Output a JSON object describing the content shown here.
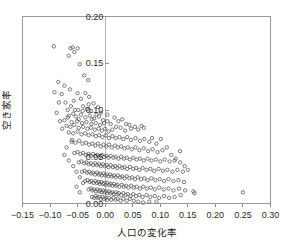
{
  "chart_data": {
    "type": "scatter",
    "title": "",
    "xlabel": "人口の変化率",
    "ylabel": "空き家率",
    "xlim": [
      -0.15,
      0.3
    ],
    "ylim": [
      0.0,
      0.2
    ],
    "xticks": [
      -0.15,
      -0.1,
      -0.05,
      0.0,
      0.05,
      0.1,
      0.15,
      0.2,
      0.25,
      0.3
    ],
    "xticklabels": [
      "−0.15",
      "−0.10",
      "−0.05",
      "0.00",
      "0.05",
      "0.10",
      "0.15",
      "0.20",
      "0.25",
      "0.30"
    ],
    "yticks": [
      0.0,
      0.05,
      0.1,
      0.15,
      0.2
    ],
    "yticklabels": [
      "0.00",
      "0.05",
      "0.10",
      "0.15",
      "0.20"
    ],
    "grid": false,
    "legend": null,
    "marker": "open-circle",
    "marker_color": "#5b5b5b",
    "marker_size": 3.4,
    "n_points": 372,
    "points": [
      [
        -0.093,
        0.168
      ],
      [
        -0.063,
        0.166
      ],
      [
        -0.059,
        0.167
      ],
      [
        -0.05,
        0.166
      ],
      [
        -0.066,
        0.158
      ],
      [
        -0.056,
        0.162
      ],
      [
        -0.046,
        0.149
      ],
      [
        -0.038,
        0.137
      ],
      [
        -0.085,
        0.13
      ],
      [
        -0.074,
        0.126
      ],
      [
        -0.031,
        0.132
      ],
      [
        -0.064,
        0.122
      ],
      [
        -0.05,
        0.118
      ],
      [
        -0.036,
        0.118
      ],
      [
        -0.029,
        0.114
      ],
      [
        -0.057,
        0.11
      ],
      [
        -0.044,
        0.112
      ],
      [
        -0.021,
        0.107
      ],
      [
        -0.04,
        0.104
      ],
      [
        -0.033,
        0.101
      ],
      [
        -0.049,
        0.1
      ],
      [
        -0.026,
        0.099
      ],
      [
        -0.013,
        0.103
      ],
      [
        -0.058,
        0.096
      ],
      [
        -0.066,
        0.094
      ],
      [
        -0.068,
        0.092
      ],
      [
        -0.053,
        0.093
      ],
      [
        -0.044,
        0.095
      ],
      [
        -0.036,
        0.092
      ],
      [
        -0.028,
        0.094
      ],
      [
        -0.02,
        0.091
      ],
      [
        -0.011,
        0.093
      ],
      [
        -0.004,
        0.089
      ],
      [
        -0.074,
        0.089
      ],
      [
        -0.061,
        0.087
      ],
      [
        -0.051,
        0.088
      ],
      [
        -0.042,
        0.086
      ],
      [
        -0.034,
        0.087
      ],
      [
        -0.025,
        0.085
      ],
      [
        -0.017,
        0.086
      ],
      [
        -0.009,
        0.084
      ],
      [
        -0.002,
        0.086
      ],
      [
        0.004,
        0.088
      ],
      [
        0.01,
        0.085
      ],
      [
        -0.07,
        0.083
      ],
      [
        -0.063,
        0.082
      ],
      [
        -0.056,
        0.084
      ],
      [
        -0.048,
        0.081
      ],
      [
        -0.04,
        0.082
      ],
      [
        -0.032,
        0.08
      ],
      [
        -0.026,
        0.081
      ],
      [
        -0.019,
        0.079
      ],
      [
        -0.012,
        0.08
      ],
      [
        -0.006,
        0.078
      ],
      [
        0.0,
        0.08
      ],
      [
        0.006,
        0.077
      ],
      [
        0.013,
        0.079
      ],
      [
        0.02,
        0.082
      ],
      [
        0.028,
        0.081
      ],
      [
        0.036,
        0.078
      ],
      [
        0.047,
        0.08
      ],
      [
        0.054,
        0.082
      ],
      [
        0.06,
        0.079
      ],
      [
        -0.066,
        0.076
      ],
      [
        -0.058,
        0.075
      ],
      [
        -0.05,
        0.077
      ],
      [
        -0.043,
        0.074
      ],
      [
        -0.036,
        0.075
      ],
      [
        -0.03,
        0.073
      ],
      [
        -0.023,
        0.074
      ],
      [
        -0.017,
        0.072
      ],
      [
        -0.011,
        0.073
      ],
      [
        -0.005,
        0.071
      ],
      [
        0.001,
        0.073
      ],
      [
        0.007,
        0.07
      ],
      [
        0.013,
        0.072
      ],
      [
        0.019,
        0.07
      ],
      [
        0.026,
        0.071
      ],
      [
        0.033,
        0.069
      ],
      [
        0.04,
        0.071
      ],
      [
        0.047,
        0.068
      ],
      [
        0.055,
        0.07
      ],
      [
        0.063,
        0.067
      ],
      [
        0.071,
        0.069
      ],
      [
        0.08,
        0.066
      ],
      [
        0.101,
        0.069
      ],
      [
        -0.061,
        0.066
      ],
      [
        -0.054,
        0.065
      ],
      [
        -0.047,
        0.067
      ],
      [
        -0.041,
        0.064
      ],
      [
        -0.035,
        0.065
      ],
      [
        -0.029,
        0.063
      ],
      [
        -0.023,
        0.064
      ],
      [
        -0.018,
        0.062
      ],
      [
        -0.013,
        0.064
      ],
      [
        -0.008,
        0.061
      ],
      [
        -0.003,
        0.063
      ],
      [
        0.002,
        0.061
      ],
      [
        0.007,
        0.063
      ],
      [
        0.012,
        0.06
      ],
      [
        0.018,
        0.062
      ],
      [
        0.023,
        0.06
      ],
      [
        0.029,
        0.061
      ],
      [
        0.035,
        0.059
      ],
      [
        0.041,
        0.06
      ],
      [
        0.048,
        0.058
      ],
      [
        0.055,
        0.06
      ],
      [
        0.062,
        0.057
      ],
      [
        0.07,
        0.059
      ],
      [
        0.078,
        0.056
      ],
      [
        0.086,
        0.058
      ],
      [
        0.095,
        0.055
      ],
      [
        0.104,
        0.057
      ],
      [
        -0.056,
        0.054
      ],
      [
        -0.05,
        0.055
      ],
      [
        -0.045,
        0.053
      ],
      [
        -0.04,
        0.054
      ],
      [
        -0.035,
        0.052
      ],
      [
        -0.03,
        0.053
      ],
      [
        -0.026,
        0.051
      ],
      [
        -0.022,
        0.053
      ],
      [
        -0.018,
        0.051
      ],
      [
        -0.014,
        0.052
      ],
      [
        -0.01,
        0.05
      ],
      [
        -0.006,
        0.052
      ],
      [
        -0.002,
        0.05
      ],
      [
        0.002,
        0.051
      ],
      [
        0.006,
        0.049
      ],
      [
        0.01,
        0.051
      ],
      [
        0.015,
        0.049
      ],
      [
        0.019,
        0.05
      ],
      [
        0.024,
        0.048
      ],
      [
        0.029,
        0.05
      ],
      [
        0.034,
        0.048
      ],
      [
        0.039,
        0.049
      ],
      [
        0.045,
        0.047
      ],
      [
        0.051,
        0.049
      ],
      [
        0.057,
        0.047
      ],
      [
        0.063,
        0.048
      ],
      [
        0.07,
        0.046
      ],
      [
        0.077,
        0.048
      ],
      [
        0.084,
        0.046
      ],
      [
        0.092,
        0.047
      ],
      [
        0.1,
        0.045
      ],
      [
        0.108,
        0.047
      ],
      [
        0.117,
        0.045
      ],
      [
        0.126,
        0.046
      ],
      [
        0.136,
        0.044
      ],
      [
        -0.048,
        0.044
      ],
      [
        -0.043,
        0.045
      ],
      [
        -0.038,
        0.043
      ],
      [
        -0.034,
        0.044
      ],
      [
        -0.03,
        0.042
      ],
      [
        -0.026,
        0.043
      ],
      [
        -0.022,
        0.041
      ],
      [
        -0.018,
        0.043
      ],
      [
        -0.015,
        0.041
      ],
      [
        -0.011,
        0.042
      ],
      [
        -0.008,
        0.04
      ],
      [
        -0.004,
        0.042
      ],
      [
        -0.001,
        0.04
      ],
      [
        0.003,
        0.041
      ],
      [
        0.006,
        0.039
      ],
      [
        0.01,
        0.041
      ],
      [
        0.014,
        0.039
      ],
      [
        0.018,
        0.04
      ],
      [
        0.022,
        0.038
      ],
      [
        0.026,
        0.04
      ],
      [
        0.031,
        0.038
      ],
      [
        0.035,
        0.039
      ],
      [
        0.04,
        0.037
      ],
      [
        0.045,
        0.039
      ],
      [
        0.051,
        0.037
      ],
      [
        0.056,
        0.038
      ],
      [
        0.062,
        0.036
      ],
      [
        0.068,
        0.038
      ],
      [
        0.075,
        0.036
      ],
      [
        0.082,
        0.037
      ],
      [
        0.089,
        0.035
      ],
      [
        0.097,
        0.037
      ],
      [
        0.105,
        0.035
      ],
      [
        0.113,
        0.036
      ],
      [
        0.122,
        0.034
      ],
      [
        0.131,
        0.036
      ],
      [
        0.141,
        0.034
      ],
      [
        -0.042,
        0.034
      ],
      [
        -0.037,
        0.035
      ],
      [
        -0.033,
        0.033
      ],
      [
        -0.029,
        0.034
      ],
      [
        -0.025,
        0.032
      ],
      [
        -0.022,
        0.033
      ],
      [
        -0.018,
        0.031
      ],
      [
        -0.015,
        0.033
      ],
      [
        -0.012,
        0.031
      ],
      [
        -0.009,
        0.032
      ],
      [
        -0.006,
        0.03
      ],
      [
        -0.003,
        0.032
      ],
      [
        0.0,
        0.03
      ],
      [
        0.003,
        0.031
      ],
      [
        0.006,
        0.029
      ],
      [
        0.009,
        0.031
      ],
      [
        0.012,
        0.029
      ],
      [
        0.016,
        0.03
      ],
      [
        0.019,
        0.028
      ],
      [
        0.023,
        0.03
      ],
      [
        0.027,
        0.028
      ],
      [
        0.031,
        0.029
      ],
      [
        0.035,
        0.027
      ],
      [
        0.039,
        0.029
      ],
      [
        0.044,
        0.027
      ],
      [
        0.049,
        0.028
      ],
      [
        0.054,
        0.026
      ],
      [
        0.059,
        0.028
      ],
      [
        0.065,
        0.026
      ],
      [
        0.071,
        0.027
      ],
      [
        0.077,
        0.025
      ],
      [
        0.084,
        0.027
      ],
      [
        0.091,
        0.025
      ],
      [
        0.099,
        0.026
      ],
      [
        0.107,
        0.024
      ],
      [
        0.115,
        0.026
      ],
      [
        0.124,
        0.024
      ],
      [
        0.133,
        0.025
      ],
      [
        0.143,
        0.023
      ],
      [
        -0.036,
        0.024
      ],
      [
        -0.032,
        0.025
      ],
      [
        -0.028,
        0.023
      ],
      [
        -0.025,
        0.024
      ],
      [
        -0.021,
        0.022
      ],
      [
        -0.018,
        0.024
      ],
      [
        -0.015,
        0.022
      ],
      [
        -0.012,
        0.023
      ],
      [
        -0.01,
        0.021
      ],
      [
        -0.007,
        0.023
      ],
      [
        -0.004,
        0.021
      ],
      [
        -0.002,
        0.022
      ],
      [
        0.001,
        0.02
      ],
      [
        0.004,
        0.022
      ],
      [
        0.007,
        0.02
      ],
      [
        0.01,
        0.021
      ],
      [
        0.013,
        0.019
      ],
      [
        0.016,
        0.021
      ],
      [
        0.019,
        0.019
      ],
      [
        0.022,
        0.02
      ],
      [
        0.026,
        0.018
      ],
      [
        0.03,
        0.02
      ],
      [
        0.034,
        0.018
      ],
      [
        0.038,
        0.019
      ],
      [
        0.042,
        0.017
      ],
      [
        0.047,
        0.019
      ],
      [
        0.052,
        0.017
      ],
      [
        0.057,
        0.018
      ],
      [
        0.063,
        0.016
      ],
      [
        0.069,
        0.018
      ],
      [
        0.076,
        0.016
      ],
      [
        0.083,
        0.017
      ],
      [
        0.09,
        0.015
      ],
      [
        0.098,
        0.017
      ],
      [
        0.106,
        0.015
      ],
      [
        0.115,
        0.016
      ],
      [
        0.124,
        0.014
      ],
      [
        0.134,
        0.016
      ],
      [
        0.145,
        0.014
      ],
      [
        -0.03,
        0.015
      ],
      [
        -0.026,
        0.016
      ],
      [
        -0.023,
        0.014
      ],
      [
        -0.02,
        0.015
      ],
      [
        -0.017,
        0.013
      ],
      [
        -0.014,
        0.015
      ],
      [
        -0.011,
        0.013
      ],
      [
        -0.009,
        0.014
      ],
      [
        -0.006,
        0.012
      ],
      [
        -0.004,
        0.014
      ],
      [
        -0.001,
        0.012
      ],
      [
        0.002,
        0.013
      ],
      [
        0.004,
        0.011
      ],
      [
        0.007,
        0.013
      ],
      [
        0.01,
        0.011
      ],
      [
        0.013,
        0.012
      ],
      [
        0.016,
        0.01
      ],
      [
        0.019,
        0.012
      ],
      [
        0.022,
        0.01
      ],
      [
        0.025,
        0.011
      ],
      [
        0.029,
        0.009
      ],
      [
        0.033,
        0.011
      ],
      [
        0.037,
        0.009
      ],
      [
        0.041,
        0.01
      ],
      [
        0.046,
        0.008
      ],
      [
        0.051,
        0.01
      ],
      [
        0.056,
        0.008
      ],
      [
        0.062,
        0.009
      ],
      [
        0.068,
        0.007
      ],
      [
        0.075,
        0.009
      ],
      [
        0.082,
        0.007
      ],
      [
        0.09,
        0.008
      ],
      [
        0.098,
        0.006
      ],
      [
        0.107,
        0.008
      ],
      [
        0.116,
        0.006
      ],
      [
        0.126,
        0.007
      ],
      [
        0.137,
        0.009
      ],
      [
        0.16,
        0.013
      ],
      [
        0.162,
        0.011
      ],
      [
        0.25,
        0.012
      ],
      [
        -0.024,
        0.007
      ],
      [
        -0.02,
        0.006
      ],
      [
        -0.017,
        0.008
      ],
      [
        -0.014,
        0.006
      ],
      [
        -0.011,
        0.007
      ],
      [
        -0.008,
        0.005
      ],
      [
        -0.005,
        0.007
      ],
      [
        -0.002,
        0.005
      ],
      [
        0.001,
        0.006
      ],
      [
        0.004,
        0.004
      ],
      [
        0.007,
        0.006
      ],
      [
        0.011,
        0.004
      ],
      [
        0.015,
        0.006
      ],
      [
        0.019,
        0.004
      ],
      [
        0.023,
        0.005
      ],
      [
        0.028,
        0.003
      ],
      [
        0.033,
        0.005
      ],
      [
        0.039,
        0.003
      ],
      [
        0.045,
        0.005
      ],
      [
        0.052,
        0.003
      ],
      [
        0.06,
        0.002
      ],
      [
        0.069,
        0.001
      ],
      [
        0.08,
        0.002
      ],
      [
        0.093,
        0.002
      ],
      [
        -0.07,
        0.06
      ],
      [
        -0.074,
        0.052
      ],
      [
        -0.066,
        0.046
      ],
      [
        -0.058,
        0.04
      ],
      [
        -0.052,
        0.034
      ],
      [
        -0.046,
        0.028
      ],
      [
        -0.04,
        0.022
      ],
      [
        -0.052,
        0.018
      ],
      [
        -0.046,
        0.012
      ],
      [
        -0.06,
        0.068
      ],
      [
        -0.078,
        0.08
      ],
      [
        -0.082,
        0.088
      ],
      [
        -0.088,
        0.097
      ],
      [
        -0.084,
        0.108
      ],
      [
        -0.092,
        0.119
      ],
      [
        -0.079,
        0.117
      ],
      [
        -0.072,
        0.108
      ],
      [
        -0.068,
        0.1
      ],
      [
        -0.062,
        0.104
      ],
      [
        -0.055,
        0.1
      ],
      [
        -0.048,
        0.09
      ],
      [
        -0.03,
        0.106
      ],
      [
        -0.041,
        0.099
      ],
      [
        -0.024,
        0.09
      ],
      [
        -0.016,
        0.095
      ],
      [
        -0.008,
        0.097
      ],
      [
        0.004,
        0.095
      ],
      [
        0.017,
        0.092
      ],
      [
        0.024,
        0.088
      ],
      [
        0.031,
        0.09
      ],
      [
        0.038,
        0.085
      ],
      [
        0.044,
        0.084
      ],
      [
        0.066,
        0.083
      ],
      [
        0.07,
        0.081
      ],
      [
        0.085,
        0.07
      ],
      [
        0.093,
        0.064
      ],
      [
        0.112,
        0.06
      ],
      [
        0.12,
        0.052
      ],
      [
        0.128,
        0.048
      ],
      [
        0.136,
        0.056
      ],
      [
        0.144,
        0.04
      ],
      [
        0.15,
        0.036
      ]
    ]
  }
}
